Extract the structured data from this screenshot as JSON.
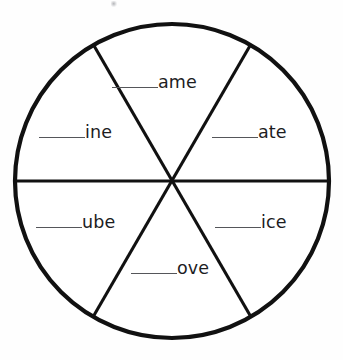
{
  "page": {
    "type": "word-family-wheel-worksheet",
    "background_color": "#fefefe"
  },
  "wheel": {
    "shape": "circle",
    "sector_count": 6,
    "stroke_color": "#111111",
    "outline_width_px": 4,
    "divider_width_px": 3,
    "center_x": 172,
    "center_y": 181,
    "radius": 158,
    "divider_angles_deg": [
      0,
      60,
      120
    ],
    "sectors": [
      {
        "position": "top",
        "blank": "______",
        "rime": "ame",
        "full_label": "______ame"
      },
      {
        "position": "upper-right",
        "blank": "______",
        "rime": "ate",
        "full_label": "______ate"
      },
      {
        "position": "lower-right",
        "blank": "______",
        "rime": "ice",
        "full_label": "______ice"
      },
      {
        "position": "bottom",
        "blank": "______",
        "rime": "ove",
        "full_label": "______ove"
      },
      {
        "position": "lower-left",
        "blank": "______",
        "rime": "ube",
        "full_label": "______ube"
      },
      {
        "position": "upper-left",
        "blank": "______",
        "rime": "ine",
        "full_label": "______ine"
      }
    ]
  },
  "marks": {
    "scan_smudge_visible": true
  },
  "colors": {
    "ink": "#111111",
    "text": "#1d1d1f",
    "blank_rule": "#55565a",
    "paper": "#fefefe"
  }
}
